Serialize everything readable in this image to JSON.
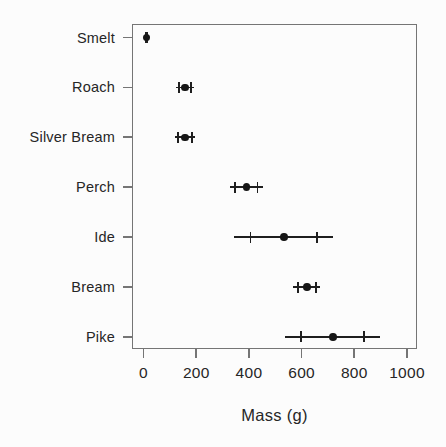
{
  "chart_data": {
    "type": "scatter",
    "subtype": "horizontal-dot-plot-with-error-bars",
    "title": "",
    "xlabel": "Mass (g)",
    "ylabel": "",
    "categories": [
      "Smelt",
      "Roach",
      "Silver Bream",
      "Perch",
      "Ide",
      "Bream",
      "Pike"
    ],
    "series": [
      {
        "name": "Mean mass with error bars",
        "marker": "filled-circle",
        "points": [
          {
            "category": "Smelt",
            "mean": 11,
            "cap_low": 10,
            "cap_high": 12,
            "whisker_low": 9,
            "whisker_high": 13
          },
          {
            "category": "Roach",
            "mean": 157,
            "cap_low": 135,
            "cap_high": 179,
            "whisker_low": 124,
            "whisker_high": 190
          },
          {
            "category": "Silver Bream",
            "mean": 157,
            "cap_low": 131,
            "cap_high": 183,
            "whisker_low": 118,
            "whisker_high": 196
          },
          {
            "category": "Perch",
            "mean": 390,
            "cap_low": 348,
            "cap_high": 432,
            "whisker_low": 327,
            "whisker_high": 453
          },
          {
            "category": "Ide",
            "mean": 532,
            "cap_low": 406,
            "cap_high": 658,
            "whisker_low": 343,
            "whisker_high": 721
          },
          {
            "category": "Bream",
            "mean": 620,
            "cap_low": 586,
            "cap_high": 654,
            "whisker_low": 569,
            "whisker_high": 671
          },
          {
            "category": "Pike",
            "mean": 718,
            "cap_low": 598,
            "cap_high": 838,
            "whisker_low": 538,
            "whisker_high": 898
          }
        ]
      }
    ],
    "x_ticks": [
      0,
      200,
      400,
      600,
      800,
      1000
    ],
    "xlim": [
      -44,
      1038
    ],
    "grid": false,
    "legend": "none"
  },
  "style": {
    "background": "#fcfcfc",
    "marker_color": "#161616",
    "error_bar_color": "#1f1f1f",
    "axis_color": "#757575",
    "text_color": "#262626"
  }
}
